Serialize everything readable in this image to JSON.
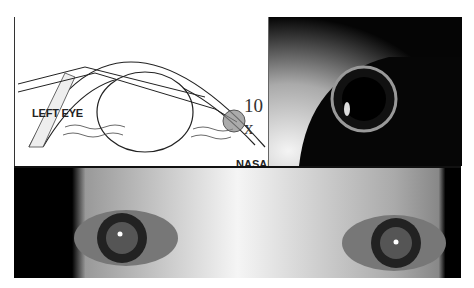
{
  "figure": {
    "diagram": {
      "labels": {
        "side": "LEFT EYE",
        "region": "NASAL",
        "magnification": "10 x"
      }
    },
    "photos": {
      "closeup": "closeup-eye-photo",
      "both_eyes": "both-eyes-photo"
    }
  }
}
